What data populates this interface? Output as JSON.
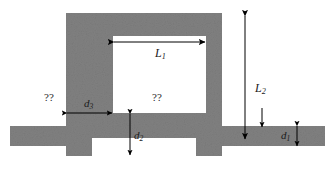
{
  "figure": {
    "type": "technical-diagram",
    "background_color": "#ffffff",
    "material_color": "#808080",
    "aperture_color": "#ffffff",
    "line_color": "#000000"
  },
  "labels": {
    "top_width": {
      "symbol": "L",
      "subscript": "1",
      "text": "L1"
    },
    "right_height": {
      "symbol": "L",
      "subscript": "2",
      "text": "L2"
    },
    "right_bar_thickness": {
      "symbol": "d",
      "subscript": "1",
      "text": "d1"
    },
    "bottom_wall_thickness": {
      "symbol": "d",
      "subscript": "2",
      "text": "d2"
    },
    "left_wall_thickness": {
      "symbol": "d",
      "subscript": "3",
      "text": "d3"
    },
    "left_region_unknown": "??",
    "aperture_region_unknown": "??"
  },
  "dimensions": {
    "image_width": 335,
    "image_height": 174,
    "arrows": [
      {
        "name": "L1-dimension",
        "orientation": "horizontal",
        "double_headed": true
      },
      {
        "name": "L2-dimension",
        "orientation": "vertical",
        "double_headed": true
      },
      {
        "name": "d1-dimension",
        "orientation": "vertical",
        "double_headed": true
      },
      {
        "name": "d2-dimension",
        "orientation": "vertical",
        "double_headed": true
      },
      {
        "name": "d3-dimension",
        "orientation": "horizontal",
        "double_headed": true
      }
    ]
  }
}
